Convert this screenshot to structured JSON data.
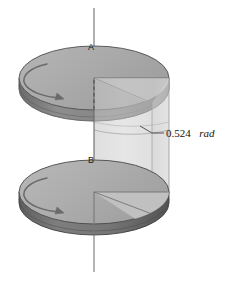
{
  "figure": {
    "background_color": "#ffffff",
    "width": 229,
    "height": 282
  },
  "axis": {
    "name": "rotation-axis",
    "color": "#6f6f6f",
    "x": 94,
    "y_top": 8,
    "y_bottom": 272
  },
  "disks": [
    {
      "id": "A",
      "label": "A",
      "label_x": 88,
      "label_y": 50,
      "center_x": 94,
      "center_y": 78,
      "rx": 75,
      "ry": 32,
      "thickness": 11,
      "top_color": "#a8a8a8",
      "top_color_light": "#b9b9b9",
      "rim_color": "#8a8a8a",
      "rim_shadow_color": "#6e6e6e",
      "edge_color": "#5a5a5a",
      "wedge_color": "#bdbdbd",
      "arrow_color": "#6a6a6a",
      "rotation_direction": "clockwise"
    },
    {
      "id": "B",
      "label": "B",
      "label_x": 88,
      "label_y": 163,
      "center_x": 94,
      "center_y": 192,
      "rx": 75,
      "ry": 32,
      "thickness": 11,
      "top_color": "#a8a8a8",
      "top_color_light": "#bcbcbc",
      "rim_color": "#7d7d7d",
      "rim_shadow_color": "#626262",
      "edge_color": "#4e4e4e",
      "wedge_color": "#c2c2c2",
      "arrow_color": "#6a6a6a",
      "rotation_direction": "clockwise"
    }
  ],
  "angle_annotation": {
    "name": "angle-annotation",
    "value": "0.524",
    "unit": "rad",
    "full_text": "0.524 rad",
    "text_x": 166,
    "text_y": 137,
    "leader_color": "#4a4a4a",
    "leader_from_x": 140,
    "leader_from_y": 126,
    "leader_bend_x": 152,
    "leader_bend_y": 133,
    "leader_to_x": 164,
    "leader_to_y": 133
  },
  "wedge_solid": {
    "name": "translucent-angular-sector",
    "fill_color": "#c9c9c9",
    "fill_opacity": 0.62,
    "stroke_color": "#9a9a9a",
    "highlight_color": "#d6d6d6"
  },
  "legend": {
    "title": "",
    "items": []
  }
}
